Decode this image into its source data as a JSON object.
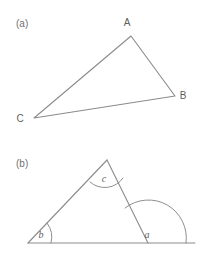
{
  "figure": {
    "background_color": "#ffffff",
    "stroke_color": "#8b8b8b",
    "text_color": "#5e5e5e",
    "panels": [
      {
        "id": "a",
        "label": "(a)",
        "label_x": 16,
        "label_y": 27,
        "type": "triangle",
        "description": "scalene triangle with labelled vertices A, B, C",
        "vertices": [
          {
            "name": "A",
            "x": 131,
            "y": 36,
            "label": "A",
            "label_x": 127,
            "label_y": 26
          },
          {
            "name": "B",
            "x": 175,
            "y": 96,
            "label": "B",
            "label_x": 183,
            "label_y": 99
          },
          {
            "name": "C",
            "x": 34,
            "y": 118,
            "label": "C",
            "label_x": 20,
            "label_y": 122
          }
        ],
        "edges": [
          {
            "from": "A",
            "to": "B"
          },
          {
            "from": "B",
            "to": "C"
          },
          {
            "from": "C",
            "to": "A"
          }
        ]
      },
      {
        "id": "b",
        "label": "(b)",
        "label_x": 16,
        "label_y": 167,
        "type": "triangle-with-extended-base",
        "description": "triangle on a horizontal baseline that extends past the right vertex, with angle arcs a, b and c marked",
        "vertices": [
          {
            "name": "apex",
            "x": 107,
            "y": 160
          },
          {
            "name": "left",
            "x": 28,
            "y": 243
          },
          {
            "name": "right",
            "x": 148,
            "y": 243
          }
        ],
        "baseline": {
          "x1": 28,
          "y1": 243,
          "x2": 195,
          "y2": 243
        },
        "edges": [
          {
            "from": "left",
            "to": "apex"
          },
          {
            "from": "apex",
            "to": "right"
          },
          {
            "from": "left",
            "to": "right"
          }
        ],
        "angles": [
          {
            "name": "c",
            "label": "c",
            "label_x": 104,
            "label_y": 182,
            "at_vertex": "apex",
            "arc_path": "M 90 182 A 22 22 0 0 0 123 178",
            "kind": "interior"
          },
          {
            "name": "b",
            "label": "b",
            "label_x": 41,
            "label_y": 238,
            "at_vertex": "left",
            "arc_path": "M 46 224 A 22 22 0 0 1 51 243",
            "kind": "interior"
          },
          {
            "name": "a",
            "label": "a",
            "label_x": 147,
            "label_y": 238,
            "at_vertex": "right",
            "arc_path": "M 124 207 A 38 38 0 0 1 186 243",
            "kind": "exterior"
          }
        ]
      }
    ]
  }
}
